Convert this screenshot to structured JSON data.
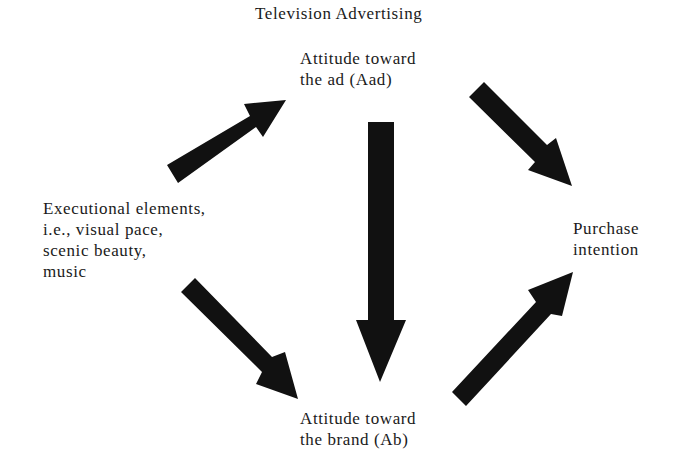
{
  "title": "Television Advertising",
  "nodes": {
    "aad": {
      "lines": [
        "Attitude toward",
        "the ad (Aad)"
      ]
    },
    "exec": {
      "lines": [
        "Executional elements,",
        "i.e., visual pace,",
        "scenic beauty,",
        "music"
      ]
    },
    "ab": {
      "lines": [
        "Attitude toward",
        "the brand (Ab)"
      ]
    },
    "pi": {
      "lines": [
        "Purchase",
        "intention"
      ]
    }
  },
  "edges": [
    {
      "from": "Executional elements",
      "to": "Attitude toward the ad (Aad)"
    },
    {
      "from": "Attitude toward the ad (Aad)",
      "to": "Purchase intention"
    },
    {
      "from": "Attitude toward the ad (Aad)",
      "to": "Attitude toward the brand (Ab)"
    },
    {
      "from": "Executional elements",
      "to": "Attitude toward the brand (Ab)"
    },
    {
      "from": "Attitude toward the brand (Ab)",
      "to": "Purchase intention"
    }
  ],
  "colors": {
    "arrow": "#111111",
    "text": "#1a1a1a",
    "background": "#ffffff"
  }
}
